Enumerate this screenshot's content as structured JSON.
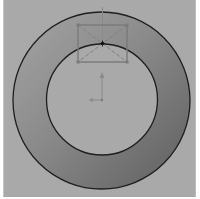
{
  "viewport": {
    "background": "#a9a9a9",
    "ring_color_light": "#a0a0a0",
    "ring_color_dark": "#646464",
    "line_color": "#1e1e1e",
    "construction_color": "#7d7d7d",
    "point_color": "#111111"
  },
  "sketch": {
    "outer_circle": {
      "cx": 100.5,
      "cy": 100.5,
      "r": 88.5
    },
    "inner_circle": {
      "cx": 101,
      "cy": 99.5,
      "r": 55.5
    },
    "rectangle": {
      "x": 77,
      "y": 25,
      "width": 49,
      "height": 37
    },
    "rectangle_center_point": {
      "x": 101.5,
      "y": 43.5
    },
    "vertical_construction_line": {
      "x": 101.5,
      "y1": 7,
      "y2": 43.5
    }
  },
  "origin": {
    "x": 101,
    "y": 100,
    "y_axis_length": 27,
    "x_axis_length": 12
  }
}
